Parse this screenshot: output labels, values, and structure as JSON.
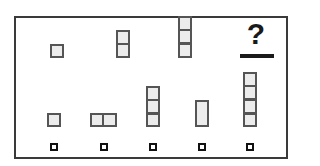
{
  "puzzle": {
    "question_mark": "?",
    "sequence": [
      {
        "id": "seq-1",
        "left": 50,
        "top": 44,
        "cells": [
          {
            "x": 0,
            "y": 0,
            "w": 14,
            "h": 14
          }
        ]
      },
      {
        "id": "seq-2",
        "left": 116,
        "top": 30,
        "cells": [
          {
            "x": 0,
            "y": 0,
            "w": 14,
            "h": 15
          },
          {
            "x": 0,
            "y": 13,
            "w": 14,
            "h": 15
          }
        ]
      },
      {
        "id": "seq-3",
        "left": 178,
        "top": 16,
        "cells": [
          {
            "x": 0,
            "y": 0,
            "w": 14,
            "h": 15
          },
          {
            "x": 0,
            "y": 13,
            "w": 14,
            "h": 15
          },
          {
            "x": 0,
            "y": 27,
            "w": 14,
            "h": 15
          }
        ]
      }
    ],
    "options": [
      {
        "id": "option-1",
        "left": 47,
        "top": 113,
        "marker_left": 50,
        "cells": [
          {
            "x": 0,
            "y": 0,
            "w": 14,
            "h": 14
          }
        ]
      },
      {
        "id": "option-2",
        "left": 90,
        "top": 113,
        "marker_left": 100,
        "cells": [
          {
            "x": 0,
            "y": 0,
            "w": 14,
            "h": 14
          },
          {
            "x": 12,
            "y": 0,
            "w": 15,
            "h": 14
          }
        ]
      },
      {
        "id": "option-3",
        "left": 146,
        "top": 86,
        "marker_left": 149,
        "cells": [
          {
            "x": 0,
            "y": 0,
            "w": 14,
            "h": 15
          },
          {
            "x": 0,
            "y": 13,
            "w": 14,
            "h": 15
          },
          {
            "x": 0,
            "y": 27,
            "w": 14,
            "h": 14
          }
        ]
      },
      {
        "id": "option-4",
        "left": 195,
        "top": 100,
        "marker_left": 198,
        "cells": [
          {
            "x": 0,
            "y": 0,
            "w": 14,
            "h": 27
          }
        ]
      },
      {
        "id": "option-5",
        "left": 243,
        "top": 72,
        "marker_left": 246,
        "cells": [
          {
            "x": 0,
            "y": 0,
            "w": 14,
            "h": 15
          },
          {
            "x": 0,
            "y": 13,
            "w": 14,
            "h": 15
          },
          {
            "x": 0,
            "y": 27,
            "w": 14,
            "h": 15
          },
          {
            "x": 0,
            "y": 41,
            "w": 14,
            "h": 14
          }
        ]
      }
    ],
    "marker_top": 143
  },
  "colors": {
    "cell_fill": "#ececec",
    "cell_border": "#555555",
    "frame_border": "#3a3a3a",
    "text": "#1a1a1a"
  }
}
